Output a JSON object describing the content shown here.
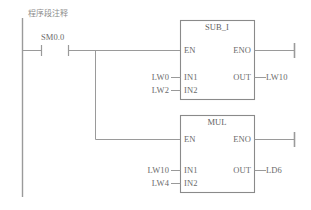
{
  "diagram": {
    "kind": "plc-ladder-logic",
    "network_comment": "程序段注释",
    "colors": {
      "background": "#ffffff",
      "line": "#9a9a9a",
      "box_line": "#8a8a8a",
      "text": "#6b6b6b",
      "comment_text": "#8d8d8d"
    },
    "rail": {
      "name": "left-power-rail"
    },
    "contact": {
      "label": "SM0.0",
      "type": "normally-open"
    },
    "blocks": [
      {
        "id": "sub-i",
        "title": "SUB_I",
        "enable_in": "EN",
        "enable_out": "ENO",
        "inputs": [
          {
            "pin": "IN1",
            "operand": "LW0"
          },
          {
            "pin": "IN2",
            "operand": "LW2"
          }
        ],
        "outputs": [
          {
            "pin": "OUT",
            "operand": "LW10"
          }
        ]
      },
      {
        "id": "mul",
        "title": "MUL",
        "enable_in": "EN",
        "enable_out": "ENO",
        "inputs": [
          {
            "pin": "IN1",
            "operand": "LW10"
          },
          {
            "pin": "IN2",
            "operand": "LW4"
          }
        ],
        "outputs": [
          {
            "pin": "OUT",
            "operand": "LD6"
          }
        ]
      }
    ]
  }
}
